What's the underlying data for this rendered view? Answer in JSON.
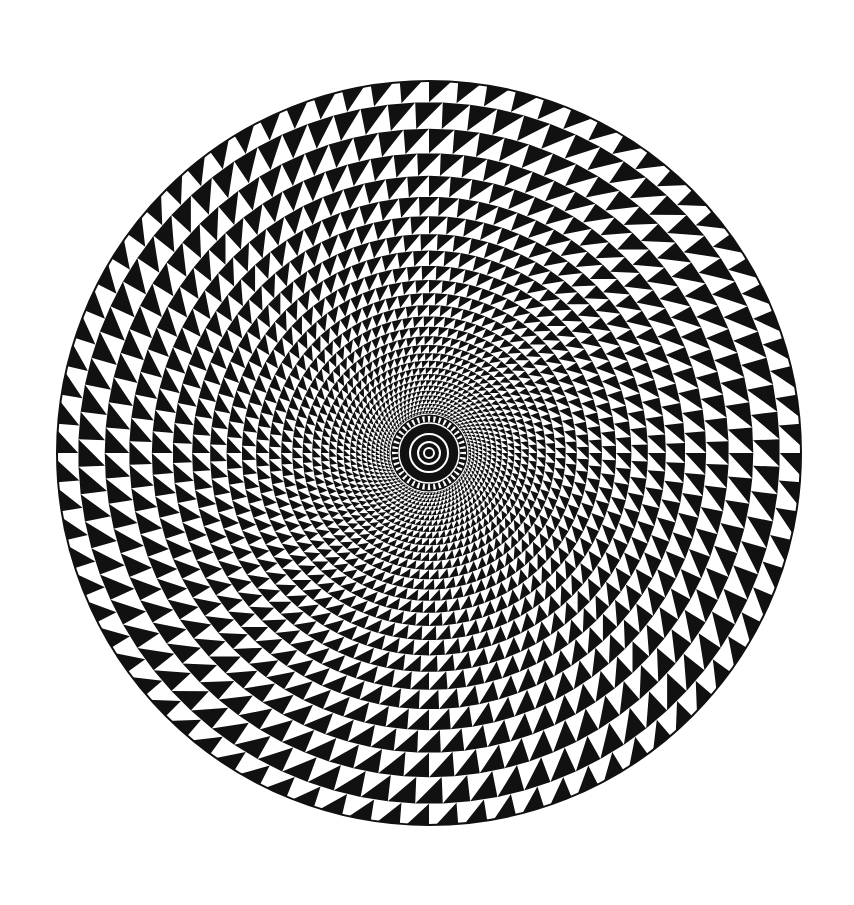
{
  "image": {
    "title": "Spiral triangle optical illusion",
    "description": "Black and white triangles arranged on a log-polar grid forming a circular vortex with a radial hub at the center"
  },
  "figure": {
    "width": 854,
    "height": 905,
    "center": [
      429,
      453
    ],
    "outer_radius": 372,
    "hub_radius": 40,
    "sectors": 80,
    "foreground": "#111111",
    "background": "#ffffff",
    "hub": {
      "spoke_count": 40,
      "rings": [
        30,
        19,
        11,
        5
      ]
    }
  }
}
